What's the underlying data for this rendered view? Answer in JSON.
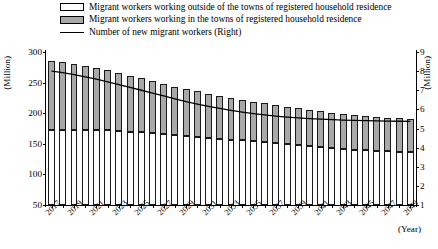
{
  "legend": {
    "items": [
      {
        "swatch": "white-square",
        "label": "Migrant workers working outside of the towns of registered household residence"
      },
      {
        "swatch": "gray-square",
        "label": "Migrant workers working in the towns of registered household residence"
      },
      {
        "swatch": "black-line",
        "label": "Number of new migrant workers (Right)"
      }
    ]
  },
  "axes": {
    "left_caption": "(Million)",
    "right_caption": "(Million)",
    "x_caption": "(Year)",
    "left_ticks": [
      "50",
      "100",
      "150",
      "200",
      "250",
      "300"
    ],
    "right_ticks": [
      "1",
      "2",
      "3",
      "4",
      "5",
      "6",
      "7",
      "8",
      "9"
    ],
    "x_ticks": [
      "2017",
      "2019",
      "2021",
      "2023",
      "2025",
      "2027",
      "2029",
      "2031",
      "2033",
      "2035",
      "2037",
      "2039",
      "2041",
      "2043",
      "2045",
      "2047",
      "2049"
    ]
  },
  "colors": {
    "bar_outside": "#ffffff",
    "bar_inside": "#a9a9a9",
    "line": "#000000",
    "axis": "#000000"
  },
  "chart_data": {
    "type": "bar",
    "title": "",
    "xlabel": "(Year)",
    "ylabel": "(Million)",
    "ylim": [
      50,
      300
    ],
    "y2lim": [
      1,
      9
    ],
    "y2label": "(Million)",
    "grid": false,
    "legend_position": "top",
    "categories": [
      "2017",
      "2018",
      "2019",
      "2020",
      "2021",
      "2022",
      "2023",
      "2024",
      "2025",
      "2026",
      "2027",
      "2028",
      "2029",
      "2030",
      "2031",
      "2032",
      "2033",
      "2034",
      "2035",
      "2036",
      "2037",
      "2038",
      "2039",
      "2040",
      "2041",
      "2042",
      "2043",
      "2044",
      "2045",
      "2046",
      "2047",
      "2048",
      "2049"
    ],
    "series": [
      {
        "name": "Migrant workers working outside of the towns of registered household residence",
        "axis": "left",
        "stack": "total",
        "values": [
          172.0,
          172.5,
          173.0,
          172.8,
          172.5,
          172.0,
          171.0,
          170.0,
          169.0,
          167.5,
          166.0,
          164.5,
          163.0,
          161.5,
          160.0,
          158.5,
          157.0,
          155.5,
          154.0,
          152.5,
          151.0,
          149.5,
          148.0,
          146.5,
          145.0,
          143.5,
          142.0,
          140.5,
          139.5,
          138.5,
          137.5,
          137.0,
          136.5
        ]
      },
      {
        "name": "Migrant workers working in the towns of registered household residence",
        "axis": "left",
        "stack": "total",
        "values": [
          114.0,
          111.0,
          108.0,
          105.0,
          101.5,
          98.0,
          94.5,
          91.0,
          88.0,
          85.0,
          82.0,
          79.0,
          76.5,
          74.0,
          72.0,
          70.0,
          68.0,
          66.5,
          65.0,
          63.5,
          62.0,
          61.0,
          60.0,
          59.0,
          58.0,
          57.5,
          57.0,
          56.5,
          56.0,
          55.5,
          55.0,
          54.5,
          54.0
        ]
      },
      {
        "name": "Number of new migrant workers (Right)",
        "axis": "right",
        "type": "line",
        "values": [
          8.0,
          7.92,
          7.82,
          7.7,
          7.58,
          7.44,
          7.3,
          7.15,
          7.0,
          6.85,
          6.7,
          6.55,
          6.4,
          6.28,
          6.16,
          6.05,
          5.95,
          5.86,
          5.78,
          5.71,
          5.65,
          5.6,
          5.56,
          5.52,
          5.49,
          5.46,
          5.44,
          5.42,
          5.41,
          5.4,
          5.39,
          5.38,
          5.37
        ]
      }
    ],
    "totals": [
      286.0,
      283.5,
      281.0,
      277.8,
      274.0,
      270.0,
      265.5,
      261.0,
      257.0,
      252.5,
      248.0,
      243.5,
      239.5,
      235.5,
      232.0,
      228.5,
      225.0,
      222.0,
      219.0,
      216.0,
      213.0,
      210.5,
      208.0,
      205.5,
      203.0,
      201.0,
      199.0,
      197.0,
      195.5,
      194.0,
      192.5,
      191.5,
      190.5
    ]
  }
}
